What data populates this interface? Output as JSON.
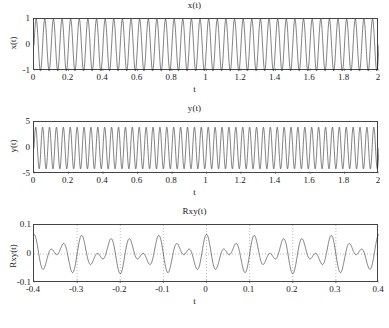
{
  "figure": {
    "background": "#ffffff",
    "line_color": "#1a1a1a",
    "grid_color": "#777777"
  },
  "chart_data": [
    {
      "type": "line",
      "name": "x-signal",
      "title": "x(t)",
      "xlabel": "t",
      "ylabel": "x(t)",
      "xlim": [
        0,
        2
      ],
      "ylim": [
        -1,
        1
      ],
      "xticks": [
        0,
        0.2,
        0.4,
        0.6,
        0.8,
        1,
        1.2,
        1.4,
        1.6,
        1.8,
        2
      ],
      "xticklabels": [
        "0",
        "0.2",
        "0.4",
        "0.6",
        "0.8",
        "1",
        "1.2",
        "1.4",
        "1.6",
        "1.8",
        "2"
      ],
      "yticks": [
        -1,
        0,
        1
      ],
      "yticklabels": [
        "-1",
        "0",
        "1"
      ],
      "grid": false,
      "series": [
        {
          "name": "x(t)",
          "expression": "sin(2*pi*f*t)",
          "amplitude": 1,
          "frequency_hz": 20,
          "phase": 0,
          "samples": 2000
        }
      ]
    },
    {
      "type": "line",
      "name": "y-signal",
      "title": "y(t)",
      "xlabel": "t",
      "ylabel": "y(t)",
      "xlim": [
        0,
        2
      ],
      "ylim": [
        -5,
        5
      ],
      "xticks": [
        0,
        0.2,
        0.4,
        0.6,
        0.8,
        1,
        1.2,
        1.4,
        1.6,
        1.8,
        2
      ],
      "xticklabels": [
        "0",
        "0.2",
        "0.4",
        "0.6",
        "0.8",
        "1",
        "1.2",
        "1.4",
        "1.6",
        "1.8",
        "2"
      ],
      "yticks": [
        -5,
        0,
        5
      ],
      "yticklabels": [
        "-5",
        "0",
        "5"
      ],
      "grid": false,
      "series": [
        {
          "name": "y(t)",
          "expression": "A*sin(2*pi*f*t)",
          "amplitude": 4,
          "frequency_hz": 25,
          "phase": 0,
          "samples": 2000
        }
      ]
    },
    {
      "type": "line",
      "name": "cross-correlation",
      "title": "Rxy(t)",
      "xlabel": "t",
      "ylabel": "Rxy(t)",
      "xlim": [
        -0.4,
        0.4
      ],
      "ylim": [
        -0.1,
        0.1
      ],
      "xticks": [
        -0.4,
        -0.3,
        -0.2,
        -0.1,
        0,
        0.1,
        0.2,
        0.3,
        0.4
      ],
      "xticklabels": [
        "-0.4",
        "-0.3",
        "-0.2",
        "-0.1",
        "0",
        "0.1",
        "0.2",
        "0.3",
        "0.4"
      ],
      "yticks": [
        -0.1,
        0,
        0.1
      ],
      "yticklabels": [
        "-0.1",
        "0",
        "0.1"
      ],
      "grid": true,
      "grid_axis": "both",
      "series": [
        {
          "name": "Rxy(t)",
          "expression": "beat: envelope |cos(2*pi*fb*t)| modulating cos(2*pi*fc*t)",
          "carrier_hz": 22.5,
          "beat_hz": 5,
          "peak_amplitude": 0.068,
          "envelope_peaks_at": [
            -0.3,
            -0.1,
            0.1,
            0.3
          ],
          "envelope_nulls_at": [
            -0.4,
            -0.2,
            0,
            0.2,
            0.4
          ],
          "samples": 1600
        }
      ]
    }
  ]
}
